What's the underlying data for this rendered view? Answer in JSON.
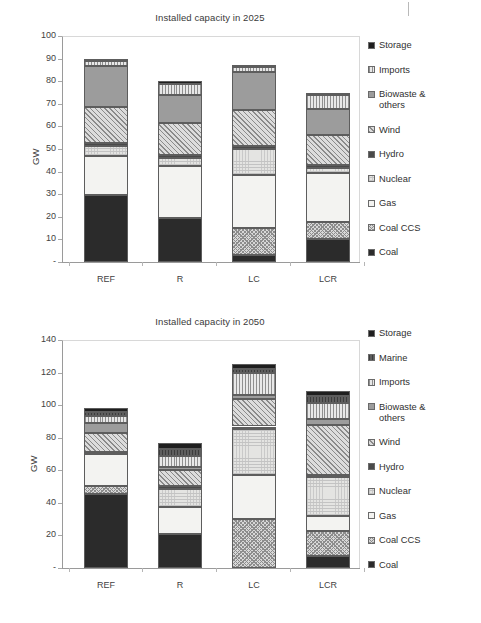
{
  "page": {
    "margin_mark": "|"
  },
  "series_styles": {
    "Coal": "f-coal",
    "Coal CCS": "f-coalccs",
    "Gas": "f-gas",
    "Nuclear": "f-nuclear",
    "Hydro": "f-hydro",
    "Wind": "f-wind",
    "Biowaste & others": "f-biowaste",
    "Imports": "f-imports",
    "Marine": "f-marine",
    "Storage": "f-storage"
  },
  "chart_data": [
    {
      "id": "chart-2025",
      "type": "bar",
      "stacked": true,
      "title": "Installed capacity in 2025",
      "xlabel": "",
      "ylabel": "GW",
      "ylim": [
        0,
        100
      ],
      "yticks": [
        0,
        10,
        20,
        30,
        40,
        50,
        60,
        70,
        80,
        90,
        100
      ],
      "ytick_labels": [
        "-",
        "10",
        "20",
        "30",
        "40",
        "50",
        "60",
        "70",
        "80",
        "90",
        "100"
      ],
      "grid": false,
      "legend_position": "right",
      "categories": [
        "REF",
        "R",
        "LC",
        "LCR"
      ],
      "series": [
        {
          "name": "Coal",
          "values": [
            29.5,
            19.4,
            3.0,
            10.0
          ]
        },
        {
          "name": "Coal CCS",
          "values": [
            0.0,
            0.0,
            11.9,
            7.9
          ]
        },
        {
          "name": "Gas",
          "values": [
            17.4,
            23.0,
            23.5,
            21.5
          ]
        },
        {
          "name": "Nuclear",
          "values": [
            4.3,
            3.5,
            11.7,
            2.3
          ]
        },
        {
          "name": "Hydro",
          "values": [
            1.3,
            1.3,
            1.3,
            1.3
          ]
        },
        {
          "name": "Wind",
          "values": [
            16.2,
            14.4,
            15.7,
            13.4
          ]
        },
        {
          "name": "Biowaste & others",
          "values": [
            18.0,
            12.5,
            16.8,
            11.3
          ]
        },
        {
          "name": "Imports",
          "values": [
            2.1,
            4.5,
            2.2,
            6.0
          ]
        },
        {
          "name": "Storage",
          "values": [
            0.9,
            1.4,
            1.0,
            1.0
          ]
        }
      ],
      "totals": [
        88.7,
        80.0,
        85.3,
        74.5
      ]
    },
    {
      "id": "chart-2050",
      "type": "bar",
      "stacked": true,
      "title": "Installed capacity in 2050",
      "xlabel": "",
      "ylabel": "GW",
      "ylim": [
        0,
        140
      ],
      "yticks": [
        0,
        20,
        40,
        60,
        80,
        100,
        120,
        140
      ],
      "ytick_labels": [
        "-",
        "20",
        "40",
        "60",
        "80",
        "100",
        "120",
        "140"
      ],
      "grid": false,
      "legend_position": "right",
      "categories": [
        "REF",
        "R",
        "LC",
        "LCR"
      ],
      "series": [
        {
          "name": "Coal",
          "values": [
            45.5,
            20.7,
            0.0,
            7.1
          ]
        },
        {
          "name": "Coal CCS",
          "values": [
            4.8,
            0.0,
            30.4,
            15.8
          ]
        },
        {
          "name": "Gas",
          "values": [
            19.8,
            16.6,
            26.5,
            8.9
          ]
        },
        {
          "name": "Nuclear",
          "values": [
            0.0,
            11.5,
            28.7,
            24.2
          ]
        },
        {
          "name": "Hydro",
          "values": [
            1.3,
            1.3,
            1.3,
            1.3
          ]
        },
        {
          "name": "Wind",
          "values": [
            11.6,
            9.9,
            17.1,
            30.7
          ]
        },
        {
          "name": "Biowaste & others",
          "values": [
            6.3,
            2.3,
            2.4,
            3.4
          ]
        },
        {
          "name": "Imports",
          "values": [
            4.1,
            6.7,
            13.1,
            10.2
          ]
        },
        {
          "name": "Marine",
          "values": [
            2.5,
            4.3,
            2.5,
            4.0
          ]
        },
        {
          "name": "Storage",
          "values": [
            2.4,
            3.5,
            3.2,
            2.9
          ]
        }
      ],
      "totals": [
        98.3,
        76.8,
        125.2,
        108.5
      ]
    }
  ],
  "legends": [
    {
      "chart": "chart-2025",
      "items": [
        {
          "label": "Storage",
          "series": "Storage"
        },
        {
          "label": "Imports",
          "series": "Imports"
        },
        {
          "label": "Biowaste &\nothers",
          "series": "Biowaste & others"
        },
        {
          "label": "Wind",
          "series": "Wind"
        },
        {
          "label": "Hydro",
          "series": "Hydro"
        },
        {
          "label": "Nuclear",
          "series": "Nuclear"
        },
        {
          "label": "Gas",
          "series": "Gas"
        },
        {
          "label": "Coal CCS",
          "series": "Coal CCS"
        },
        {
          "label": "Coal",
          "series": "Coal"
        }
      ]
    },
    {
      "chart": "chart-2050",
      "items": [
        {
          "label": "Storage",
          "series": "Storage"
        },
        {
          "label": "Marine",
          "series": "Marine"
        },
        {
          "label": "Imports",
          "series": "Imports"
        },
        {
          "label": "Biowaste &\nothers",
          "series": "Biowaste & others"
        },
        {
          "label": "Wind",
          "series": "Wind"
        },
        {
          "label": "Hydro",
          "series": "Hydro"
        },
        {
          "label": "Nuclear",
          "series": "Nuclear"
        },
        {
          "label": "Gas",
          "series": "Gas"
        },
        {
          "label": "Coal CCS",
          "series": "Coal CCS"
        },
        {
          "label": "Coal",
          "series": "Coal"
        }
      ]
    }
  ]
}
